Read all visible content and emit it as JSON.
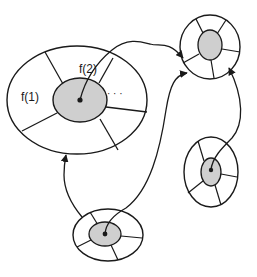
{
  "colors": {
    "stroke": "#1a1a1a",
    "inner_fill": "#cfcfcf",
    "outer_fill": "#ffffff",
    "background": "#ffffff"
  },
  "labels": {
    "f1": "f(1)",
    "f2": "f(2)",
    "ellipsis": "· · ·"
  },
  "nodes": [
    {
      "id": "large-node",
      "cx": 77,
      "cy": 100,
      "rx": 70,
      "ry": 54,
      "inner_cx": 80,
      "inner_cy": 100,
      "inner_rx": 27,
      "inner_ry": 22,
      "has_dot": true
    },
    {
      "id": "top-right-node",
      "cx": 210,
      "cy": 47,
      "rx": 30,
      "ry": 32,
      "inner_cx": 210,
      "inner_cy": 45,
      "inner_rx": 12,
      "inner_ry": 15,
      "has_dot": false
    },
    {
      "id": "right-middle-node",
      "cx": 211,
      "cy": 172,
      "rx": 27,
      "ry": 35,
      "inner_cx": 211,
      "inner_cy": 172,
      "inner_rx": 10,
      "inner_ry": 14,
      "has_dot": true
    },
    {
      "id": "bottom-node",
      "cx": 108,
      "cy": 235,
      "rx": 35,
      "ry": 26,
      "inner_cx": 105,
      "inner_cy": 234,
      "inner_rx": 16,
      "inner_ry": 12,
      "has_dot": true
    }
  ],
  "edges": [
    {
      "from": "large-node",
      "to": "top-right-node"
    },
    {
      "from": "bottom-node",
      "to": "large-node"
    },
    {
      "from": "bottom-node",
      "to": "top-right-node"
    },
    {
      "from": "right-middle-node",
      "to": "top-right-node"
    }
  ]
}
